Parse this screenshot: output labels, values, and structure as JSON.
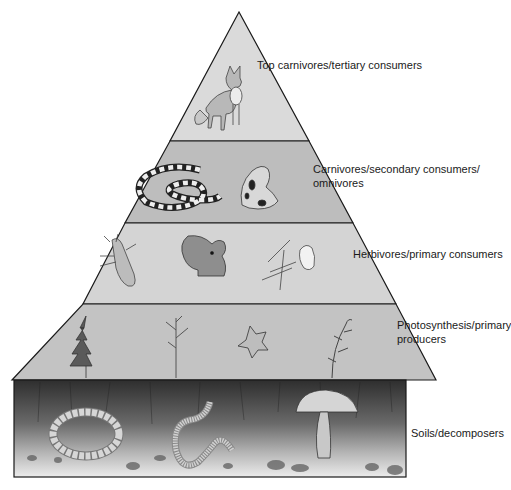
{
  "levels": [
    {
      "id": "tertiary",
      "label_lines": [
        "Top carnivores/tertiary consumers"
      ],
      "organisms": [
        "fox"
      ],
      "fill": "#d9d9d9"
    },
    {
      "id": "secondary",
      "label_lines": [
        "Carnivores/secondary consumers/",
        "omnivores"
      ],
      "organisms": [
        "snake",
        "frog"
      ],
      "fill": "#bdbdbd"
    },
    {
      "id": "primary",
      "label_lines": [
        "Herbivores/primary consumers"
      ],
      "organisms": [
        "beetle",
        "squirrel",
        "bird"
      ],
      "fill": "#d4d4d4"
    },
    {
      "id": "producers",
      "label_lines": [
        "Photosynthesis/primary",
        "producers"
      ],
      "organisms": [
        "conifer",
        "bare-tree",
        "flower",
        "shrub"
      ],
      "fill": "#c2c2c2"
    },
    {
      "id": "decomposers",
      "label_lines": [
        "Soils/decomposers"
      ],
      "organisms": [
        "grub",
        "earthworm",
        "mushroom"
      ],
      "fill_top": "#3a3a3a",
      "fill_bottom": "#e6e6e6"
    }
  ],
  "colors": {
    "outline": "#1a1a1a",
    "text": "#1a1a1a"
  }
}
